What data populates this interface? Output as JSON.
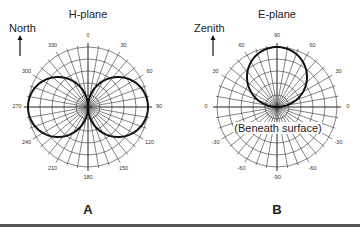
{
  "panels": [
    {
      "id": "A",
      "label": "A",
      "title": "H-plane",
      "direction_label": "North",
      "center": [
        88,
        107
      ],
      "radius": 60,
      "angle_ticks": [
        "0",
        "30",
        "60",
        "90",
        "120",
        "150",
        "180",
        "210",
        "240",
        "270",
        "300",
        "330"
      ],
      "pattern": "figure-eight (two lobes along 90/270 axis)"
    },
    {
      "id": "B",
      "label": "B",
      "title": "E-plane",
      "direction_label": "Zenith",
      "center": [
        277,
        107
      ],
      "radius": 60,
      "angle_ticks_right": [
        "90",
        "60",
        "30",
        "0",
        "-30",
        "-60",
        "-90"
      ],
      "angle_ticks_left": [
        "60",
        "30",
        "0",
        "-30",
        "-60"
      ],
      "annotation": "(Beneath surface)",
      "pattern": "single upward lobe toward 90 (zenith)"
    }
  ],
  "colors": {
    "grid": "#333333",
    "pattern": "#111111",
    "background": "#ffffff",
    "bottom_bar": "#555555"
  }
}
